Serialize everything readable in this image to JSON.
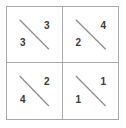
{
  "figure": {
    "name": "two-by-two-fraction-grid",
    "rows": 2,
    "columns": 2,
    "border_color": "#a8a8a8",
    "line_color": "#8c8c8c",
    "digit_color": "#3a3a3a",
    "background": "#ffffff",
    "cells": [
      {
        "position": "top-left",
        "diagonal": "backslash",
        "upper_right_value": "3",
        "lower_left_value": "3"
      },
      {
        "position": "top-right",
        "diagonal": "backslash",
        "upper_right_value": "4",
        "lower_left_value": "2"
      },
      {
        "position": "bottom-left",
        "diagonal": "backslash",
        "upper_right_value": "2",
        "lower_left_value": "4"
      },
      {
        "position": "bottom-right",
        "diagonal": "backslash",
        "upper_right_value": "1",
        "lower_left_value": "1"
      }
    ]
  }
}
